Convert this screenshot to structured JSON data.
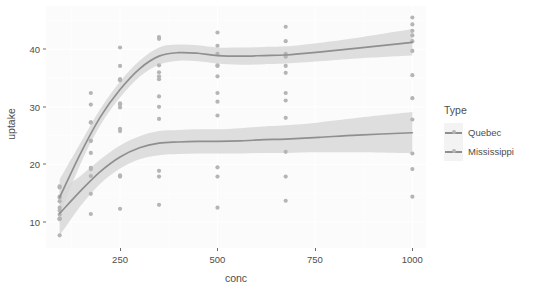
{
  "chart_data": {
    "type": "scatter",
    "title": "",
    "xlabel": "conc",
    "ylabel": "uptake",
    "xlim": [
      60,
      1035
    ],
    "ylim": [
      5.5,
      47.5
    ],
    "grid": true,
    "legend": {
      "title": "Type",
      "position": "right",
      "entries": [
        {
          "label": "Quebec",
          "color": "#9a9a9a"
        },
        {
          "label": "Mississippi",
          "color": "#a8a8a8"
        }
      ]
    },
    "xticks": [
      250,
      500,
      750,
      1000
    ],
    "yticks": [
      10,
      20,
      30,
      40
    ],
    "point_color": "#b5b5b5",
    "line_color": "#8f8f8f",
    "ribbon_color": "#d8d8d8",
    "panel_bg": "#fbfbfb",
    "grid_color": "#ffffff",
    "x": [
      95,
      175,
      250,
      350,
      500,
      675,
      1000
    ],
    "series": [
      {
        "name": "Quebec",
        "color": "#9a9a9a",
        "points": [
          {
            "x": 95,
            "y": 16.0
          },
          {
            "x": 95,
            "y": 13.6
          },
          {
            "x": 95,
            "y": 16.2
          },
          {
            "x": 95,
            "y": 14.2
          },
          {
            "x": 95,
            "y": 14.4
          },
          {
            "x": 95,
            "y": 12.5
          },
          {
            "x": 175,
            "y": 30.4
          },
          {
            "x": 175,
            "y": 27.3
          },
          {
            "x": 175,
            "y": 32.4
          },
          {
            "x": 175,
            "y": 24.1
          },
          {
            "x": 175,
            "y": 27.3
          },
          {
            "x": 175,
            "y": 24.1
          },
          {
            "x": 250,
            "y": 34.8
          },
          {
            "x": 250,
            "y": 37.1
          },
          {
            "x": 250,
            "y": 40.3
          },
          {
            "x": 250,
            "y": 34.6
          },
          {
            "x": 250,
            "y": 29.9
          },
          {
            "x": 250,
            "y": 30.4
          },
          {
            "x": 350,
            "y": 37.2
          },
          {
            "x": 350,
            "y": 41.8
          },
          {
            "x": 350,
            "y": 42.1
          },
          {
            "x": 350,
            "y": 36.0
          },
          {
            "x": 350,
            "y": 35.3
          },
          {
            "x": 350,
            "y": 34.8
          },
          {
            "x": 500,
            "y": 35.3
          },
          {
            "x": 500,
            "y": 40.6
          },
          {
            "x": 500,
            "y": 42.9
          },
          {
            "x": 500,
            "y": 37.2
          },
          {
            "x": 500,
            "y": 39.2
          },
          {
            "x": 500,
            "y": 37.1
          },
          {
            "x": 675,
            "y": 39.2
          },
          {
            "x": 675,
            "y": 41.4
          },
          {
            "x": 675,
            "y": 43.9
          },
          {
            "x": 675,
            "y": 35.9
          },
          {
            "x": 675,
            "y": 38.7
          },
          {
            "x": 675,
            "y": 37.1
          },
          {
            "x": 1000,
            "y": 39.7
          },
          {
            "x": 1000,
            "y": 44.3
          },
          {
            "x": 1000,
            "y": 45.5
          },
          {
            "x": 1000,
            "y": 43.2
          },
          {
            "x": 1000,
            "y": 41.4
          },
          {
            "x": 1000,
            "y": 42.4
          }
        ],
        "smooth": [
          {
            "x": 95,
            "y": 14.3
          },
          {
            "x": 150,
            "y": 22.1
          },
          {
            "x": 200,
            "y": 28.3
          },
          {
            "x": 250,
            "y": 33.0
          },
          {
            "x": 300,
            "y": 36.6
          },
          {
            "x": 350,
            "y": 38.8
          },
          {
            "x": 400,
            "y": 39.4
          },
          {
            "x": 450,
            "y": 39.3
          },
          {
            "x": 500,
            "y": 38.9
          },
          {
            "x": 560,
            "y": 38.8
          },
          {
            "x": 620,
            "y": 38.9
          },
          {
            "x": 675,
            "y": 39.0
          },
          {
            "x": 760,
            "y": 39.5
          },
          {
            "x": 860,
            "y": 40.2
          },
          {
            "x": 1000,
            "y": 41.2
          }
        ],
        "ribbon_lower": [
          {
            "x": 95,
            "y": 11.2
          },
          {
            "x": 150,
            "y": 20.3
          },
          {
            "x": 200,
            "y": 26.9
          },
          {
            "x": 250,
            "y": 31.6
          },
          {
            "x": 300,
            "y": 35.2
          },
          {
            "x": 350,
            "y": 37.3
          },
          {
            "x": 400,
            "y": 38.0
          },
          {
            "x": 450,
            "y": 37.9
          },
          {
            "x": 500,
            "y": 37.5
          },
          {
            "x": 560,
            "y": 37.3
          },
          {
            "x": 620,
            "y": 37.4
          },
          {
            "x": 675,
            "y": 37.5
          },
          {
            "x": 760,
            "y": 37.9
          },
          {
            "x": 860,
            "y": 38.4
          },
          {
            "x": 1000,
            "y": 38.9
          }
        ],
        "ribbon_upper": [
          {
            "x": 95,
            "y": 17.4
          },
          {
            "x": 150,
            "y": 23.9
          },
          {
            "x": 200,
            "y": 29.7
          },
          {
            "x": 250,
            "y": 34.4
          },
          {
            "x": 300,
            "y": 38.0
          },
          {
            "x": 350,
            "y": 40.3
          },
          {
            "x": 400,
            "y": 40.8
          },
          {
            "x": 450,
            "y": 40.7
          },
          {
            "x": 500,
            "y": 40.3
          },
          {
            "x": 560,
            "y": 40.3
          },
          {
            "x": 620,
            "y": 40.4
          },
          {
            "x": 675,
            "y": 40.5
          },
          {
            "x": 760,
            "y": 41.1
          },
          {
            "x": 860,
            "y": 42.0
          },
          {
            "x": 1000,
            "y": 43.5
          }
        ]
      },
      {
        "name": "Mississippi",
        "color": "#a8a8a8",
        "points": [
          {
            "x": 95,
            "y": 10.6
          },
          {
            "x": 95,
            "y": 12.0
          },
          {
            "x": 95,
            "y": 11.3
          },
          {
            "x": 95,
            "y": 10.5
          },
          {
            "x": 95,
            "y": 7.7
          },
          {
            "x": 95,
            "y": 10.6
          },
          {
            "x": 175,
            "y": 19.2
          },
          {
            "x": 175,
            "y": 22.0
          },
          {
            "x": 175,
            "y": 19.4
          },
          {
            "x": 175,
            "y": 14.9
          },
          {
            "x": 175,
            "y": 11.4
          },
          {
            "x": 175,
            "y": 18.0
          },
          {
            "x": 250,
            "y": 26.2
          },
          {
            "x": 250,
            "y": 30.6
          },
          {
            "x": 250,
            "y": 25.8
          },
          {
            "x": 250,
            "y": 18.1
          },
          {
            "x": 250,
            "y": 12.3
          },
          {
            "x": 250,
            "y": 17.9
          },
          {
            "x": 350,
            "y": 30.0
          },
          {
            "x": 350,
            "y": 31.8
          },
          {
            "x": 350,
            "y": 27.9
          },
          {
            "x": 350,
            "y": 18.9
          },
          {
            "x": 350,
            "y": 13.0
          },
          {
            "x": 350,
            "y": 17.9
          },
          {
            "x": 500,
            "y": 30.9
          },
          {
            "x": 500,
            "y": 32.4
          },
          {
            "x": 500,
            "y": 28.5
          },
          {
            "x": 500,
            "y": 19.5
          },
          {
            "x": 500,
            "y": 12.5
          },
          {
            "x": 500,
            "y": 17.9
          },
          {
            "x": 675,
            "y": 32.4
          },
          {
            "x": 675,
            "y": 31.1
          },
          {
            "x": 675,
            "y": 28.1
          },
          {
            "x": 675,
            "y": 22.2
          },
          {
            "x": 675,
            "y": 13.7
          },
          {
            "x": 675,
            "y": 17.9
          },
          {
            "x": 1000,
            "y": 35.5
          },
          {
            "x": 1000,
            "y": 31.5
          },
          {
            "x": 1000,
            "y": 27.8
          },
          {
            "x": 1000,
            "y": 21.9
          },
          {
            "x": 1000,
            "y": 14.4
          },
          {
            "x": 1000,
            "y": 19.2
          }
        ],
        "smooth": [
          {
            "x": 95,
            "y": 11.5
          },
          {
            "x": 150,
            "y": 15.5
          },
          {
            "x": 200,
            "y": 18.8
          },
          {
            "x": 250,
            "y": 21.3
          },
          {
            "x": 300,
            "y": 22.9
          },
          {
            "x": 350,
            "y": 23.7
          },
          {
            "x": 400,
            "y": 23.9
          },
          {
            "x": 450,
            "y": 24.0
          },
          {
            "x": 500,
            "y": 24.0
          },
          {
            "x": 560,
            "y": 24.1
          },
          {
            "x": 620,
            "y": 24.3
          },
          {
            "x": 675,
            "y": 24.4
          },
          {
            "x": 760,
            "y": 24.7
          },
          {
            "x": 860,
            "y": 25.1
          },
          {
            "x": 1000,
            "y": 25.5
          }
        ],
        "ribbon_lower": [
          {
            "x": 95,
            "y": 7.6
          },
          {
            "x": 150,
            "y": 12.9
          },
          {
            "x": 200,
            "y": 16.7
          },
          {
            "x": 250,
            "y": 19.3
          },
          {
            "x": 300,
            "y": 20.9
          },
          {
            "x": 350,
            "y": 21.6
          },
          {
            "x": 400,
            "y": 21.8
          },
          {
            "x": 450,
            "y": 21.9
          },
          {
            "x": 500,
            "y": 21.9
          },
          {
            "x": 560,
            "y": 21.9
          },
          {
            "x": 620,
            "y": 22.0
          },
          {
            "x": 675,
            "y": 22.0
          },
          {
            "x": 760,
            "y": 22.1
          },
          {
            "x": 860,
            "y": 22.1
          },
          {
            "x": 1000,
            "y": 21.9
          }
        ],
        "ribbon_upper": [
          {
            "x": 95,
            "y": 15.4
          },
          {
            "x": 150,
            "y": 18.1
          },
          {
            "x": 200,
            "y": 20.9
          },
          {
            "x": 250,
            "y": 23.3
          },
          {
            "x": 300,
            "y": 24.9
          },
          {
            "x": 350,
            "y": 25.8
          },
          {
            "x": 400,
            "y": 26.0
          },
          {
            "x": 450,
            "y": 26.1
          },
          {
            "x": 500,
            "y": 26.1
          },
          {
            "x": 560,
            "y": 26.3
          },
          {
            "x": 620,
            "y": 26.6
          },
          {
            "x": 675,
            "y": 26.8
          },
          {
            "x": 760,
            "y": 27.3
          },
          {
            "x": 860,
            "y": 28.1
          },
          {
            "x": 1000,
            "y": 29.1
          }
        ]
      }
    ]
  }
}
